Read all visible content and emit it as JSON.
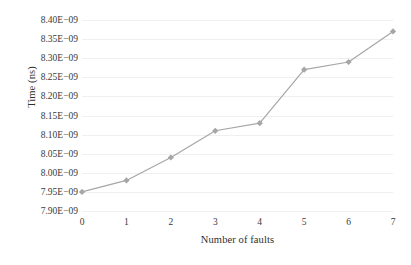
{
  "chart_data": {
    "type": "line",
    "title": "",
    "subtitle": "",
    "xlabel": "Number of faults",
    "ylabel": "Time (ns)",
    "x": [
      0,
      1,
      2,
      3,
      4,
      5,
      6,
      7
    ],
    "xtick_labels": [
      "0",
      "1",
      "2",
      "3",
      "4",
      "5",
      "6",
      "7"
    ],
    "values": [
      7.95e-09,
      7.98e-09,
      8.04e-09,
      8.11e-09,
      8.13e-09,
      8.27e-09,
      8.29e-09,
      8.37e-09
    ],
    "value_labels": [
      "7.95E-09",
      "7.98E-09",
      "8.04E-09",
      "8.11E-09",
      "8.13E-09",
      "8.27E-09",
      "8.29E-09",
      "8.37E-09"
    ],
    "ylim": [
      7.9e-09,
      8.4e-09
    ],
    "xlim": [
      0,
      7
    ],
    "ytick_values": [
      8.4e-09,
      8.35e-09,
      8.3e-09,
      8.25e-09,
      8.2e-09,
      8.15e-09,
      8.1e-09,
      8.05e-09,
      8e-09,
      7.95e-09,
      7.9e-09
    ],
    "ytick_labels": [
      "8.40E−09",
      "8.35E−09",
      "8.30E−09",
      "8.25E−09",
      "8.20E−09",
      "8.15E−09",
      "8.10E−09",
      "8.05E−09",
      "8.00E−09",
      "7.95E−09",
      "7.90E−09"
    ],
    "grid": {
      "horizontal": true,
      "vertical": false,
      "color": "#f0f0f0"
    },
    "legend": {
      "visible": false,
      "position": "none",
      "entries": []
    },
    "series": [
      {
        "name": "Time",
        "marker": "diamond",
        "line_color": "#a6a6a6",
        "marker_color": "#a6a6a6",
        "values": [
          7.95e-09,
          7.98e-09,
          8.04e-09,
          8.11e-09,
          8.13e-09,
          8.27e-09,
          8.29e-09,
          8.37e-09
        ]
      }
    ],
    "annotations": []
  },
  "style": {
    "background": "#ffffff",
    "text_color": "#3a3a3a",
    "series_color": "#a6a6a6",
    "grid_color": "#f0f0f0"
  }
}
